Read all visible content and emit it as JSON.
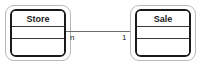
{
  "diagram": {
    "type": "entity-relationship",
    "background_color": "#ffffff",
    "entities": [
      {
        "id": "store",
        "name": "Store",
        "compartments": 3,
        "x": 5,
        "y": 5,
        "width": 66,
        "height": 56
      },
      {
        "id": "sale",
        "name": "Sale",
        "compartments": 3,
        "x": 130,
        "y": 5,
        "width": 66,
        "height": 56
      }
    ],
    "relationship": {
      "from": "store",
      "to": "sale",
      "line_color": "#6d6d6d",
      "source_cardinality": "n",
      "target_cardinality": "1"
    }
  }
}
